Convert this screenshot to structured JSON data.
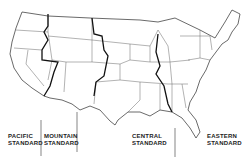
{
  "map": {
    "title": "US Time Zones",
    "zones": [
      {
        "name": "pacific",
        "line1": "PACIFIC",
        "line2": "STANDARD"
      },
      {
        "name": "mountain",
        "line1": "MOUNTAIN",
        "line2": "STANDARD"
      },
      {
        "name": "central",
        "line1": "CENTRAL",
        "line2": "STANDARD"
      },
      {
        "name": "eastern",
        "line1": "EASTERN",
        "line2": "STANDARD"
      }
    ],
    "colors": {
      "outline": "#444444",
      "zone_boundary": "#111111",
      "background": "#ffffff"
    }
  }
}
